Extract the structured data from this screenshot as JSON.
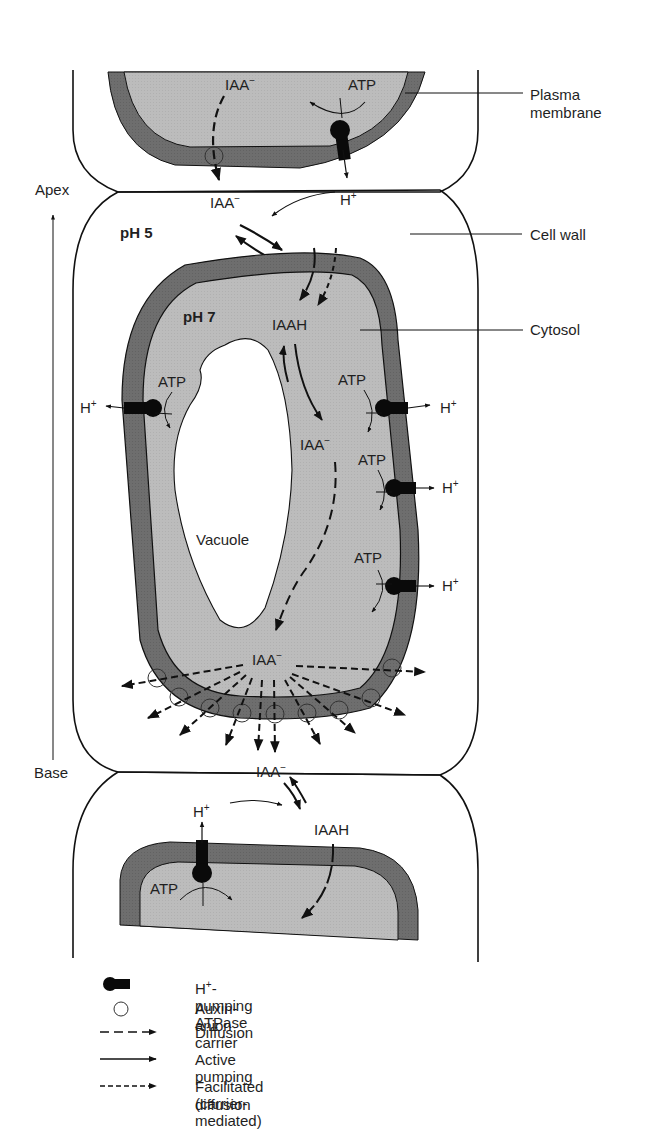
{
  "colors": {
    "membrane": "#6d6d6d",
    "cytosol": "#bdbdbd",
    "cell_wall_line": "#111111",
    "background": "#ffffff",
    "atpase": "#0a0a0a"
  },
  "orientation": {
    "apex_label": "Apex",
    "base_label": "Base"
  },
  "callouts": {
    "plasma_membrane_line1": "Plasma",
    "plasma_membrane_line2": "membrane",
    "cell_wall": "Cell wall",
    "cytosol": "Cytosol"
  },
  "compartments": {
    "wall_ph": "pH 5",
    "cytosol_ph": "pH 7",
    "vacuole": "Vacuole"
  },
  "species": {
    "iaa_anion": "IAA",
    "iaa_anion_charge": "−",
    "iaah": "IAAH",
    "proton": "H",
    "proton_charge": "+",
    "atp": "ATP"
  },
  "legend": {
    "items": [
      {
        "icon": "atpase-icon",
        "label_prefix": "H",
        "label_sup": "+",
        "label_suffix": "-pumping ATPase"
      },
      {
        "icon": "carrier-circle-icon",
        "label": "Auxin-anion carrier"
      },
      {
        "icon": "long-dash-arrow-icon",
        "label": "Diffusion"
      },
      {
        "icon": "solid-arrow-icon",
        "label": "Active pumping"
      },
      {
        "icon": "short-dash-arrow-icon",
        "label": "Facilitated (carrier-mediated)",
        "label_line2": "diffusion"
      }
    ]
  }
}
